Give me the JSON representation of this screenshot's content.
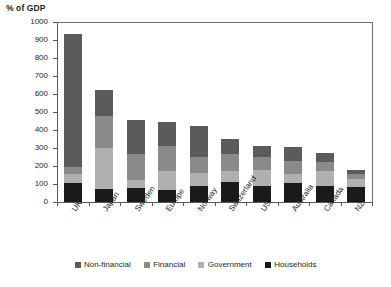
{
  "chart_data": {
    "type": "bar",
    "subtype": "stacked-bar",
    "title": "% of GDP",
    "xlabel": "",
    "ylabel": "% of GDP",
    "ylim": [
      0,
      1000
    ],
    "ytick_step": 100,
    "yticks": [
      1000,
      900,
      800,
      700,
      600,
      500,
      400,
      300,
      200,
      100,
      0
    ],
    "grid": false,
    "legend_position": "bottom",
    "categories": [
      "UK",
      "Japan",
      "Sweden",
      "Europe",
      "Norway",
      "Switzerland",
      "US",
      "Australia",
      "Canada",
      "NZ"
    ],
    "series": [
      {
        "name": "Households",
        "color": "#1a1a1a",
        "values": [
          105,
          70,
          80,
          68,
          90,
          112,
          88,
          105,
          90,
          85
        ]
      },
      {
        "name": "Government",
        "color": "#b0b0b0",
        "values": [
          48,
          230,
          45,
          102,
          70,
          63,
          92,
          50,
          85,
          42
        ]
      },
      {
        "name": "Financial",
        "color": "#8a8a8a",
        "values": [
          42,
          180,
          140,
          140,
          90,
          90,
          72,
          75,
          47,
          30
        ]
      },
      {
        "name": "Non-financial",
        "color": "#5b5b5b",
        "values": [
          740,
          145,
          190,
          137,
          175,
          85,
          60,
          75,
          50,
          23
        ]
      }
    ],
    "totals": [
      935,
      625,
      455,
      447,
      425,
      350,
      312,
      305,
      272,
      180
    ],
    "stack_order_bottom_to_top": [
      "Households",
      "Government",
      "Financial",
      "Non-financial"
    ]
  },
  "legend": {
    "items": [
      {
        "label": "Non-financial",
        "color": "#5b5b5b"
      },
      {
        "label": "Financial",
        "color": "#8a8a8a"
      },
      {
        "label": "Government",
        "color": "#b0b0b0"
      },
      {
        "label": "Households",
        "color": "#1a1a1a"
      }
    ]
  }
}
